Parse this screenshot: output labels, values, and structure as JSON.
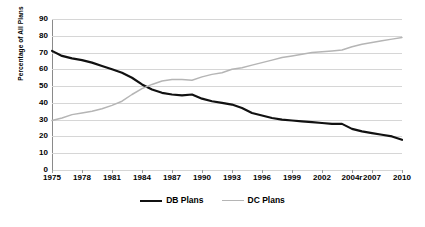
{
  "chart_data": {
    "type": "line",
    "title": "",
    "xlabel": "",
    "ylabel": "Percentage of All Plans",
    "ylim": [
      0,
      90
    ],
    "ytick_step": 10,
    "yticks": [
      "90",
      "80",
      "70",
      "60",
      "50",
      "40",
      "30",
      "20",
      "10",
      "0"
    ],
    "grid": true,
    "legend_position": "bottom",
    "xlim": [
      1975,
      2010
    ],
    "xticks": [
      "1975",
      "1978",
      "1981",
      "1984",
      "1987",
      "1990",
      "1993",
      "1996",
      "1999",
      "2002",
      "2004r",
      "2007",
      "2010"
    ],
    "xtick_years": [
      1975,
      1978,
      1981,
      1984,
      1987,
      1990,
      1993,
      1996,
      1999,
      2002,
      2005,
      2007,
      2010
    ],
    "x": [
      1975,
      1976,
      1977,
      1978,
      1979,
      1980,
      1981,
      1982,
      1983,
      1984,
      1985,
      1986,
      1987,
      1988,
      1989,
      1990,
      1991,
      1992,
      1993,
      1994,
      1995,
      1996,
      1997,
      1998,
      1999,
      2000,
      2001,
      2002,
      2003,
      2004,
      2005,
      2006,
      2007,
      2008,
      2009,
      2010
    ],
    "series": [
      {
        "name": "DB Plans",
        "color": "#111111",
        "values": [
          71,
          68,
          66.5,
          65.5,
          64,
          62,
          60,
          58,
          55,
          51,
          48,
          46,
          45,
          44.5,
          45,
          42.5,
          41,
          40,
          39,
          37,
          34,
          32.5,
          31,
          30,
          29.5,
          29,
          28.5,
          28,
          27.5,
          27.5,
          24.5,
          23,
          22,
          21,
          20,
          18
        ]
      },
      {
        "name": "DC Plans",
        "color": "#b5b5b5",
        "values": [
          29.5,
          31,
          33,
          34,
          35,
          36.5,
          38.5,
          41,
          45,
          48.5,
          51,
          53,
          54,
          54,
          53.5,
          55.5,
          57,
          58,
          60,
          61,
          62.5,
          64,
          65.5,
          67,
          68,
          69,
          70,
          70.5,
          71,
          71.5,
          73.5,
          75,
          76,
          77,
          78,
          79
        ]
      }
    ]
  },
  "legend": {
    "items": [
      {
        "label": "DB Plans"
      },
      {
        "label": "DC Plans"
      }
    ]
  }
}
